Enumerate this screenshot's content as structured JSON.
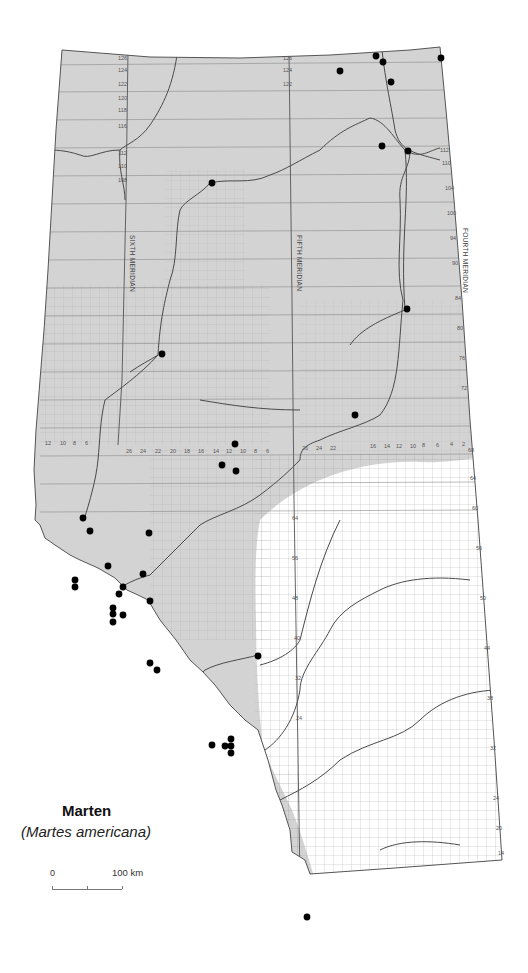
{
  "map": {
    "title": "Marten",
    "subtitle": "(Martes americana)",
    "region": "Alberta",
    "meridians": {
      "fourth": "FOURTH MERIDIAN",
      "fifth": "FIFTH MERIDIAN",
      "sixth": "SIXTH MERIDIAN"
    },
    "scale": {
      "zero_label": "0",
      "max_label": "100 km"
    },
    "colors": {
      "range_fill": "#d3d3d3",
      "outside_fill": "#ffffff",
      "border": "#555555",
      "river": "#555555",
      "grid": "#8a8a8a",
      "record_dot": "#000000"
    },
    "township_labels_left": [
      "126",
      "124",
      "122",
      "120",
      "118",
      "116",
      "112",
      "110",
      "108"
    ],
    "township_labels_right": [
      "126",
      "124",
      "122",
      "120",
      "112",
      "110",
      "108",
      "106",
      "104",
      "102",
      "100",
      "98",
      "96",
      "94",
      "92",
      "90",
      "88",
      "86",
      "84",
      "82",
      "80",
      "78",
      "76",
      "74",
      "72",
      "70",
      "68",
      "66",
      "64",
      "62",
      "60",
      "58",
      "56",
      "54",
      "52",
      "50",
      "48",
      "46",
      "44",
      "42",
      "40",
      "38",
      "36",
      "34",
      "32",
      "30",
      "28",
      "26",
      "24",
      "22",
      "20",
      "18",
      "16",
      "14",
      "12",
      "10",
      "8",
      "6",
      "4",
      "2"
    ],
    "range_labels_row": [
      "12",
      "10",
      "8",
      "6",
      "4",
      "2",
      "26",
      "24",
      "22",
      "20",
      "18",
      "16",
      "14",
      "12",
      "10",
      "8",
      "6",
      "4",
      "2"
    ],
    "legend": {
      "shaded_area": "Marten distribution range",
      "dot": "Specimen / observation record"
    },
    "records_count": 39
  }
}
